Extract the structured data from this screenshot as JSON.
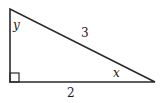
{
  "diagram": {
    "type": "right-triangle",
    "stroke_color": "#2a2a2a",
    "vertices": {
      "top": [
        10,
        9
      ],
      "right_angle": [
        10,
        82
      ],
      "right": [
        155,
        82
      ]
    },
    "labels": {
      "hypotenuse": "3",
      "base": "2",
      "angle_top": "y",
      "angle_right": "x"
    },
    "right_angle_marker": true
  }
}
